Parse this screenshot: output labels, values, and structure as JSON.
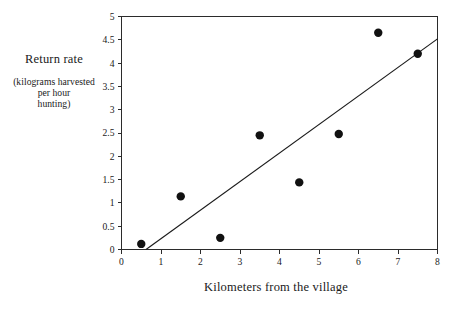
{
  "chart_data": {
    "type": "scatter",
    "title": "",
    "xlabel": "Kilometers from the village",
    "ylabel": "Return rate",
    "ylabel_sub_lines": [
      "(kilograms harvested",
      "per hour",
      "hunting)"
    ],
    "xlim": [
      0,
      8
    ],
    "ylim": [
      0,
      5
    ],
    "grid": false,
    "legend": null,
    "x_ticks": [
      "0",
      "1",
      "2",
      "3",
      "4",
      "5",
      "6",
      "7",
      "8"
    ],
    "x_tick_values": [
      0,
      1,
      2,
      3,
      4,
      5,
      6,
      7,
      8
    ],
    "y_ticks": [
      "0",
      "0.5",
      "1",
      "1.5",
      "2",
      "2.5",
      "3",
      "3.5",
      "4",
      "4.5",
      "5"
    ],
    "y_tick_values": [
      0,
      0.5,
      1,
      1.5,
      2,
      2.5,
      3,
      3.5,
      4,
      4.5,
      5
    ],
    "x": [
      0.5,
      1.5,
      2.5,
      3.5,
      4.5,
      5.5,
      6.5,
      7.5
    ],
    "y": [
      0.12,
      1.14,
      0.25,
      2.45,
      1.44,
      2.48,
      4.65,
      4.2
    ],
    "points": [
      {
        "x": 0.5,
        "y": 0.12
      },
      {
        "x": 1.5,
        "y": 1.14
      },
      {
        "x": 2.5,
        "y": 0.25
      },
      {
        "x": 3.5,
        "y": 2.45
      },
      {
        "x": 4.5,
        "y": 1.44
      },
      {
        "x": 5.5,
        "y": 2.48
      },
      {
        "x": 6.5,
        "y": 4.65
      },
      {
        "x": 7.5,
        "y": 4.2
      }
    ],
    "trendline": {
      "x_start": 0.62,
      "y_start": 0.0,
      "x_end": 8.0,
      "y_end": 4.52
    },
    "marker_color": "#111111",
    "line_color": "#1a1a1a",
    "axis_color": "#2b2b2b",
    "background": "#ffffff",
    "marker_size_px": 4.2
  },
  "axis_titles": {
    "y_main": "Return rate",
    "y_sub_1": "(kilograms harvested",
    "y_sub_2": "per hour",
    "y_sub_3": "hunting)",
    "x_main": "Kilometers from the village"
  }
}
